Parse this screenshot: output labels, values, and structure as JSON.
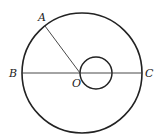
{
  "diagram": {
    "type": "geometry",
    "colors": {
      "stroke": "#222222",
      "background": "#ffffff"
    },
    "outer_circle": {
      "cx": 82,
      "cy": 73,
      "r": 60
    },
    "inner_circle": {
      "cx": 96,
      "cy": 73,
      "r": 16
    },
    "segments": [
      {
        "from": "B",
        "to": "C"
      },
      {
        "from": "O",
        "to": "A"
      }
    ],
    "points": {
      "A": {
        "label": "A",
        "x": 45,
        "y": 26
      },
      "B": {
        "label": "B",
        "x": 22,
        "y": 73
      },
      "C": {
        "label": "C",
        "x": 142,
        "y": 73
      },
      "O": {
        "label": "O",
        "x": 80,
        "y": 73
      }
    }
  }
}
